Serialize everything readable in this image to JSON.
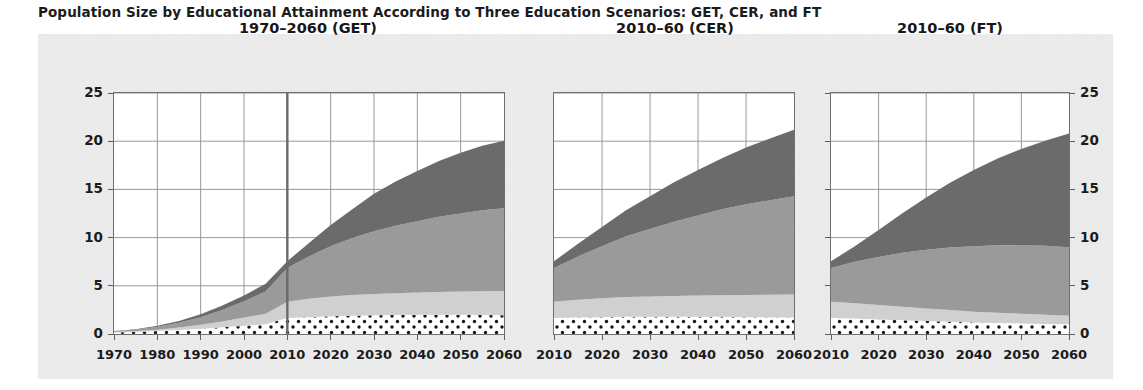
{
  "figure": {
    "title": "Population Size by Educational Attainment According to Three Education Scenarios: GET, CER, and FT",
    "ylabel": "Population (millions)",
    "background": "#ececed",
    "plot_background": "#ffffff"
  },
  "chart_data": {
    "type": "area",
    "title": "Population Size by Educational Attainment According to Three Education Scenarios: GET, CER, and FT",
    "xlabel": "",
    "ylabel": "Population (millions)",
    "ylim": [
      0,
      25
    ],
    "yticks": [
      0,
      5,
      10,
      15,
      20,
      25
    ],
    "grid": true,
    "stacked": true,
    "legend": "none",
    "series_names": [
      "No education",
      "Primary",
      "Secondary",
      "Post-secondary"
    ],
    "series_colors": [
      "#ffffff",
      "#d0d0d0",
      "#9a9a9a",
      "#6b6b6b"
    ],
    "panels": [
      {
        "title": "1970–2060 (GET)",
        "xlim": [
          1970,
          2060
        ],
        "xticks": [
          1970,
          1980,
          1990,
          2000,
          2010,
          2020,
          2030,
          2040,
          2050,
          2060
        ],
        "xticklabels": [
          "1970",
          "1980",
          "1990",
          "2000",
          "2010",
          "2020",
          "2030",
          "2040",
          "2050",
          "2060"
        ],
        "projection_start": 2010,
        "x": [
          1970,
          1975,
          1980,
          1985,
          1990,
          1995,
          2000,
          2005,
          2010,
          2015,
          2020,
          2025,
          2030,
          2035,
          2040,
          2045,
          2050,
          2055,
          2060
        ],
        "series": [
          {
            "name": "No education",
            "values": [
              0.15,
              0.2,
              0.3,
              0.42,
              0.55,
              0.7,
              0.85,
              1.0,
              1.65,
              1.75,
              1.85,
              1.9,
              1.95,
              1.98,
              2.0,
              2.0,
              2.0,
              1.98,
              1.95
            ]
          },
          {
            "name": "Primary",
            "values": [
              0.05,
              0.1,
              0.15,
              0.25,
              0.4,
              0.6,
              0.85,
              1.1,
              1.7,
              1.9,
              2.05,
              2.15,
              2.2,
              2.25,
              2.3,
              2.35,
              2.4,
              2.45,
              2.5
            ]
          },
          {
            "name": "Secondary",
            "values": [
              0.08,
              0.15,
              0.3,
              0.5,
              0.8,
              1.2,
              1.7,
              2.3,
              3.5,
              4.4,
              5.2,
              5.9,
              6.5,
              7.0,
              7.4,
              7.8,
              8.1,
              8.4,
              8.6
            ]
          },
          {
            "name": "Post-secondary",
            "values": [
              0.02,
              0.05,
              0.1,
              0.18,
              0.3,
              0.45,
              0.6,
              0.8,
              0.7,
              1.4,
              2.2,
              3.0,
              3.9,
              4.6,
              5.2,
              5.8,
              6.3,
              6.7,
              7.0
            ]
          }
        ],
        "totals": [
          0.3,
          0.5,
          0.85,
          1.35,
          2.05,
          2.95,
          4.0,
          5.2,
          7.55,
          9.45,
          11.3,
          12.95,
          14.55,
          15.83,
          16.9,
          17.95,
          18.8,
          19.53,
          20.05
        ]
      },
      {
        "title": "2010–60 (CER)",
        "xlim": [
          2010,
          2060
        ],
        "xticks": [
          2010,
          2020,
          2030,
          2040,
          2050,
          2060
        ],
        "xticklabels": [
          "2010",
          "2020",
          "2030",
          "2040",
          "2050",
          "2060"
        ],
        "projection_start": null,
        "x": [
          2010,
          2015,
          2020,
          2025,
          2030,
          2035,
          2040,
          2045,
          2050,
          2055,
          2060
        ],
        "series": [
          {
            "name": "No education",
            "values": [
              1.65,
              1.7,
              1.75,
              1.78,
              1.8,
              1.8,
              1.8,
              1.78,
              1.75,
              1.72,
              1.7
            ]
          },
          {
            "name": "Primary",
            "values": [
              1.7,
              1.85,
              1.95,
              2.05,
              2.1,
              2.15,
              2.2,
              2.25,
              2.3,
              2.35,
              2.4
            ]
          },
          {
            "name": "Secondary",
            "values": [
              3.5,
              4.5,
              5.4,
              6.3,
              7.0,
              7.7,
              8.3,
              8.9,
              9.4,
              9.8,
              10.2
            ]
          },
          {
            "name": "Post-secondary",
            "values": [
              0.7,
              1.3,
              2.0,
              2.7,
              3.4,
              4.1,
              4.7,
              5.3,
              5.9,
              6.4,
              6.9
            ]
          }
        ],
        "totals": [
          7.55,
          9.35,
          11.1,
          12.83,
          14.3,
          15.75,
          17.0,
          18.23,
          19.35,
          20.27,
          21.2
        ]
      },
      {
        "title": "2010–60 (FT)",
        "xlim": [
          2010,
          2060
        ],
        "xticks": [
          2010,
          2020,
          2030,
          2040,
          2050,
          2060
        ],
        "xticklabels": [
          "2010",
          "2020",
          "2030",
          "2040",
          "2050",
          "2060"
        ],
        "projection_start": null,
        "x": [
          2010,
          2015,
          2020,
          2025,
          2030,
          2035,
          2040,
          2045,
          2050,
          2055,
          2060
        ],
        "series": [
          {
            "name": "No education",
            "values": [
              1.65,
              1.6,
              1.5,
              1.42,
              1.35,
              1.28,
              1.2,
              1.15,
              1.1,
              1.05,
              1.0
            ]
          },
          {
            "name": "Primary",
            "values": [
              1.7,
              1.6,
              1.5,
              1.4,
              1.3,
              1.2,
              1.1,
              1.05,
              1.0,
              0.95,
              0.9
            ]
          },
          {
            "name": "Secondary",
            "values": [
              3.5,
              4.3,
              5.0,
              5.6,
              6.1,
              6.5,
              6.8,
              7.0,
              7.1,
              7.15,
              7.1
            ]
          },
          {
            "name": "Post-secondary",
            "values": [
              0.7,
              1.6,
              2.8,
              4.1,
              5.4,
              6.7,
              7.9,
              9.0,
              10.0,
              10.9,
              11.8
            ]
          }
        ],
        "totals": [
          7.55,
          9.1,
          10.8,
          12.52,
          14.15,
          15.68,
          17.0,
          18.2,
          19.2,
          20.05,
          20.8
        ]
      }
    ]
  }
}
